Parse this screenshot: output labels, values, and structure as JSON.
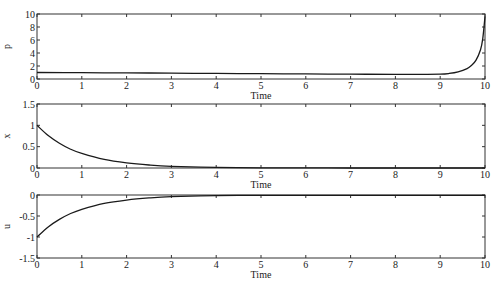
{
  "chart_data": [
    {
      "type": "line",
      "title": "",
      "xlabel": "Time",
      "ylabel": "p",
      "xlim": [
        0,
        10
      ],
      "ylim": [
        0,
        10
      ],
      "xticks": [
        0,
        1,
        2,
        3,
        4,
        5,
        6,
        7,
        8,
        9,
        10
      ],
      "yticks": [
        0,
        2,
        4,
        6,
        8,
        10
      ],
      "grid": false,
      "series": [
        {
          "name": "p",
          "x": [
            0,
            1,
            2,
            3,
            4,
            5,
            6,
            7,
            8,
            8.5,
            9,
            9.2,
            9.4,
            9.6,
            9.7,
            9.8,
            9.9,
            9.95,
            10
          ],
          "y": [
            1.0,
            0.97,
            0.94,
            0.9,
            0.86,
            0.82,
            0.78,
            0.74,
            0.72,
            0.72,
            0.75,
            0.85,
            1.1,
            1.6,
            2.1,
            2.9,
            4.5,
            6.2,
            9.6
          ]
        }
      ]
    },
    {
      "type": "line",
      "title": "",
      "xlabel": "Time",
      "ylabel": "x",
      "xlim": [
        0,
        10
      ],
      "ylim": [
        0,
        1.5
      ],
      "xticks": [
        0,
        1,
        2,
        3,
        4,
        5,
        6,
        7,
        8,
        9,
        10
      ],
      "yticks": [
        0,
        0.5,
        1,
        1.5
      ],
      "grid": false,
      "series": [
        {
          "name": "x",
          "x": [
            0,
            0.25,
            0.5,
            0.75,
            1,
            1.5,
            2,
            2.5,
            3,
            4,
            5,
            6,
            7,
            8,
            9,
            10
          ],
          "y": [
            1.0,
            0.76,
            0.58,
            0.44,
            0.34,
            0.2,
            0.12,
            0.07,
            0.04,
            0.015,
            0.005,
            0.002,
            0.0,
            0.0,
            0.0,
            0.0
          ]
        }
      ]
    },
    {
      "type": "line",
      "title": "",
      "xlabel": "Time",
      "ylabel": "u",
      "xlim": [
        0,
        10
      ],
      "ylim": [
        -1.5,
        0
      ],
      "xticks": [
        0,
        1,
        2,
        3,
        4,
        5,
        6,
        7,
        8,
        9,
        10
      ],
      "yticks": [
        -1.5,
        -1,
        -0.5,
        0
      ],
      "grid": false,
      "series": [
        {
          "name": "u",
          "x": [
            0,
            0.25,
            0.5,
            0.75,
            1,
            1.5,
            2,
            2.5,
            3,
            4,
            5,
            6,
            7,
            8,
            9,
            10
          ],
          "y": [
            -1.0,
            -0.76,
            -0.58,
            -0.44,
            -0.34,
            -0.2,
            -0.12,
            -0.07,
            -0.04,
            -0.015,
            -0.01,
            -0.01,
            -0.01,
            -0.01,
            -0.01,
            -0.01
          ]
        }
      ]
    }
  ],
  "panels": [
    {
      "ylabel": "p",
      "xlabel": "Time"
    },
    {
      "ylabel": "x",
      "xlabel": "Time"
    },
    {
      "ylabel": "u",
      "xlabel": "Time"
    }
  ],
  "style": {
    "line_color": "#1a1a1a",
    "axis_color": "#333333"
  }
}
